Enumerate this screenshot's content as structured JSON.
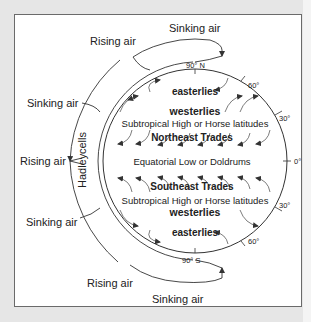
{
  "diagram": {
    "colors": {
      "background": "#e6e6e6",
      "panel": "#ffffff",
      "line": "#333333",
      "text": "#222222"
    },
    "outer_labels": {
      "rising_air_top": "Rising air",
      "sinking_air_top": "Sinking air",
      "sinking_air_upper_left": "Sinking air",
      "rising_air_left": "Rising air",
      "sinking_air_lower_left": "Sinking air",
      "rising_air_bottom": "Rising air",
      "sinking_air_bottom": "Sinking air",
      "hadley": "Hadley",
      "cells": "cells"
    },
    "latitude_labels": {
      "north_pole": "90° N",
      "south_pole": "90° S",
      "n60": "60°",
      "n30": "30°",
      "equator": "0°",
      "s30": "30°",
      "s60": "60°"
    },
    "zones": {
      "easterlies_north": "easterlies",
      "westerlies_north": "westerlies",
      "horse_north": "Subtropical High or Horse latitudes",
      "ne_trades": "Northeast Trades",
      "doldrums": "Equatorial Low or Doldrums",
      "se_trades": "Southeast Trades",
      "horse_south": "Subtropical High or Horse latitudes",
      "westerlies_south": "westerlies",
      "easterlies_south": "easterlies"
    }
  }
}
